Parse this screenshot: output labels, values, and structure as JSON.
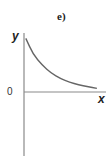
{
  "chart_data": {
    "type": "line",
    "title": "e)",
    "xlabel": "x",
    "ylabel": "y",
    "origin_label": "0",
    "grid": false,
    "legend": null,
    "series": [
      {
        "name": "curve",
        "x": [
          0.1,
          0.5,
          1.0,
          1.5,
          2.0,
          2.5,
          3.0,
          3.5,
          4.0
        ],
        "values": [
          3.0,
          2.1,
          1.5,
          1.05,
          0.75,
          0.55,
          0.4,
          0.3,
          0.2
        ]
      }
    ],
    "xlim": [
      0,
      4.5
    ],
    "ylim": [
      -3,
      3.3
    ]
  },
  "colors": {
    "axis": "#8a8a8a",
    "curve": "#666666",
    "text": "#222222",
    "background": "#ffffff"
  }
}
